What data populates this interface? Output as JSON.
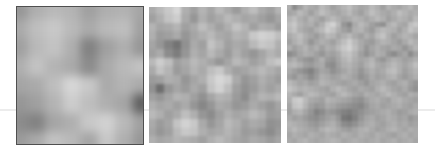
{
  "figure": {
    "background": "#ffffff",
    "panels": [
      {
        "id": "panel-1",
        "label": "coarse-noise",
        "cols": 8,
        "rows": 8,
        "values": [
          [
            150,
            175,
            185,
            180,
            160,
            175,
            178,
            165
          ],
          [
            170,
            190,
            200,
            185,
            170,
            185,
            190,
            160
          ],
          [
            160,
            185,
            195,
            175,
            130,
            160,
            175,
            150
          ],
          [
            175,
            195,
            180,
            170,
            140,
            170,
            185,
            195
          ],
          [
            165,
            170,
            190,
            215,
            200,
            170,
            180,
            170
          ],
          [
            150,
            160,
            180,
            205,
            190,
            175,
            165,
            95
          ],
          [
            140,
            130,
            165,
            175,
            200,
            210,
            185,
            160
          ],
          [
            155,
            170,
            195,
            185,
            165,
            200,
            175,
            150
          ]
        ]
      },
      {
        "id": "panel-2",
        "label": "medium-noise",
        "cols": 16,
        "rows": 16,
        "values": [
          [
            170,
            185,
            200,
            215,
            175,
            160,
            180,
            165,
            185,
            170,
            155,
            175,
            190,
            170,
            160,
            180
          ],
          [
            160,
            175,
            195,
            205,
            170,
            150,
            175,
            160,
            170,
            185,
            175,
            165,
            170,
            160,
            150,
            165
          ],
          [
            180,
            165,
            170,
            180,
            160,
            170,
            190,
            175,
            160,
            175,
            195,
            180,
            160,
            175,
            170,
            155
          ],
          [
            175,
            155,
            160,
            170,
            150,
            165,
            175,
            185,
            170,
            165,
            180,
            175,
            200,
            210,
            205,
            190
          ],
          [
            165,
            150,
            130,
            115,
            145,
            170,
            160,
            195,
            180,
            160,
            170,
            165,
            185,
            200,
            195,
            175
          ],
          [
            160,
            170,
            140,
            125,
            150,
            175,
            165,
            185,
            170,
            155,
            175,
            160,
            150,
            165,
            180,
            170
          ],
          [
            185,
            205,
            190,
            160,
            170,
            185,
            175,
            165,
            150,
            165,
            185,
            175,
            160,
            170,
            190,
            200
          ],
          [
            170,
            195,
            180,
            155,
            165,
            180,
            170,
            190,
            200,
            175,
            160,
            165,
            175,
            185,
            175,
            165
          ],
          [
            155,
            160,
            175,
            170,
            150,
            165,
            175,
            200,
            215,
            205,
            170,
            150,
            160,
            175,
            165,
            155
          ],
          [
            145,
            110,
            150,
            165,
            155,
            170,
            160,
            195,
            210,
            190,
            160,
            145,
            155,
            170,
            160,
            170
          ],
          [
            160,
            150,
            165,
            180,
            175,
            160,
            145,
            165,
            180,
            175,
            155,
            140,
            165,
            180,
            175,
            185
          ],
          [
            175,
            165,
            170,
            160,
            170,
            150,
            135,
            150,
            170,
            165,
            150,
            155,
            170,
            160,
            150,
            165
          ],
          [
            185,
            175,
            160,
            170,
            190,
            175,
            150,
            140,
            160,
            175,
            165,
            170,
            185,
            175,
            155,
            160
          ],
          [
            170,
            155,
            165,
            195,
            210,
            200,
            170,
            150,
            165,
            185,
            175,
            160,
            170,
            165,
            145,
            150
          ],
          [
            165,
            150,
            160,
            185,
            200,
            195,
            175,
            165,
            170,
            180,
            170,
            155,
            160,
            150,
            140,
            155
          ],
          [
            175,
            165,
            170,
            180,
            175,
            170,
            160,
            175,
            185,
            175,
            165,
            160,
            170,
            165,
            155,
            165
          ]
        ]
      },
      {
        "id": "panel-3",
        "label": "fine-noise",
        "cols": 24,
        "rows": 24,
        "values": [
          [
            175,
            140,
            160,
            180,
            170,
            165,
            185,
            175,
            160,
            170,
            180,
            190,
            175,
            165,
            170,
            185,
            175,
            160,
            180,
            170,
            165,
            175,
            185,
            170
          ],
          [
            165,
            170,
            185,
            175,
            160,
            175,
            190,
            180,
            170,
            165,
            175,
            185,
            170,
            160,
            175,
            190,
            180,
            170,
            165,
            175,
            190,
            180,
            170,
            175
          ],
          [
            180,
            190,
            175,
            165,
            180,
            170,
            160,
            175,
            185,
            175,
            165,
            170,
            180,
            175,
            165,
            175,
            185,
            175,
            160,
            170,
            180,
            175,
            165,
            185
          ],
          [
            190,
            200,
            180,
            170,
            175,
            160,
            175,
            200,
            210,
            185,
            150,
            135,
            170,
            185,
            175,
            160,
            150,
            145,
            175,
            185,
            170,
            165,
            190,
            200
          ],
          [
            185,
            195,
            175,
            165,
            160,
            175,
            185,
            205,
            195,
            175,
            160,
            150,
            175,
            180,
            165,
            155,
            175,
            185,
            180,
            175,
            160,
            175,
            195,
            185
          ],
          [
            170,
            180,
            190,
            175,
            165,
            155,
            170,
            185,
            180,
            165,
            175,
            185,
            170,
            160,
            175,
            165,
            185,
            195,
            175,
            160,
            170,
            180,
            175,
            165
          ],
          [
            160,
            175,
            185,
            170,
            150,
            165,
            175,
            170,
            160,
            175,
            190,
            205,
            185,
            170,
            160,
            155,
            170,
            180,
            175,
            165,
            155,
            170,
            185,
            175
          ],
          [
            175,
            160,
            170,
            180,
            165,
            175,
            160,
            175,
            170,
            185,
            200,
            210,
            190,
            170,
            150,
            165,
            175,
            165,
            160,
            170,
            165,
            150,
            165,
            180
          ],
          [
            140,
            150,
            165,
            175,
            170,
            160,
            150,
            165,
            160,
            170,
            190,
            195,
            180,
            160,
            145,
            160,
            175,
            170,
            150,
            140,
            155,
            165,
            140,
            160
          ],
          [
            165,
            175,
            160,
            150,
            145,
            160,
            175,
            155,
            150,
            165,
            180,
            190,
            175,
            165,
            170,
            180,
            160,
            150,
            165,
            175,
            170,
            160,
            165,
            175
          ],
          [
            180,
            185,
            175,
            160,
            155,
            165,
            170,
            145,
            140,
            160,
            175,
            180,
            170,
            160,
            175,
            185,
            170,
            165,
            175,
            185,
            175,
            165,
            175,
            190
          ],
          [
            170,
            160,
            150,
            140,
            130,
            150,
            165,
            160,
            145,
            155,
            165,
            175,
            165,
            150,
            165,
            175,
            165,
            170,
            185,
            190,
            175,
            160,
            170,
            180
          ],
          [
            160,
            150,
            165,
            155,
            140,
            155,
            175,
            170,
            160,
            165,
            175,
            170,
            160,
            145,
            155,
            170,
            160,
            165,
            175,
            180,
            165,
            155,
            165,
            175
          ],
          [
            185,
            175,
            165,
            170,
            160,
            165,
            180,
            175,
            170,
            165,
            160,
            165,
            170,
            160,
            150,
            165,
            170,
            175,
            165,
            160,
            170,
            175,
            160,
            150
          ],
          [
            195,
            185,
            175,
            180,
            175,
            170,
            165,
            160,
            175,
            185,
            175,
            165,
            160,
            170,
            165,
            160,
            175,
            185,
            175,
            165,
            160,
            170,
            155,
            145
          ],
          [
            180,
            170,
            160,
            175,
            185,
            180,
            170,
            165,
            160,
            175,
            185,
            175,
            165,
            160,
            175,
            170,
            165,
            175,
            185,
            175,
            165,
            160,
            175,
            170
          ],
          [
            175,
            200,
            205,
            185,
            170,
            165,
            160,
            180,
            175,
            170,
            165,
            160,
            150,
            145,
            160,
            170,
            175,
            165,
            160,
            175,
            180,
            170,
            165,
            160
          ],
          [
            165,
            195,
            200,
            180,
            160,
            150,
            155,
            170,
            165,
            155,
            150,
            145,
            140,
            135,
            150,
            165,
            170,
            160,
            165,
            170,
            175,
            165,
            160,
            170
          ],
          [
            160,
            175,
            180,
            165,
            150,
            130,
            140,
            155,
            150,
            140,
            130,
            125,
            135,
            145,
            155,
            160,
            165,
            170,
            175,
            165,
            155,
            160,
            170,
            175
          ],
          [
            170,
            160,
            165,
            155,
            145,
            140,
            150,
            160,
            165,
            150,
            120,
            115,
            130,
            150,
            165,
            170,
            160,
            165,
            175,
            170,
            160,
            165,
            150,
            160
          ],
          [
            180,
            175,
            170,
            165,
            155,
            150,
            160,
            170,
            175,
            160,
            140,
            135,
            145,
            160,
            170,
            175,
            165,
            160,
            170,
            175,
            165,
            170,
            160,
            165
          ],
          [
            175,
            185,
            175,
            170,
            165,
            160,
            175,
            185,
            180,
            170,
            160,
            155,
            165,
            175,
            180,
            170,
            160,
            165,
            175,
            180,
            170,
            165,
            175,
            170
          ],
          [
            165,
            175,
            170,
            165,
            175,
            170,
            165,
            175,
            170,
            165,
            175,
            170,
            165,
            175,
            170,
            165,
            175,
            170,
            165,
            160,
            170,
            175,
            165,
            170
          ],
          [
            170,
            165,
            175,
            180,
            170,
            165,
            170,
            175,
            180,
            175,
            165,
            170,
            175,
            170,
            165,
            170,
            175,
            165,
            170,
            175,
            165,
            170,
            175,
            165
          ]
        ]
      }
    ]
  }
}
